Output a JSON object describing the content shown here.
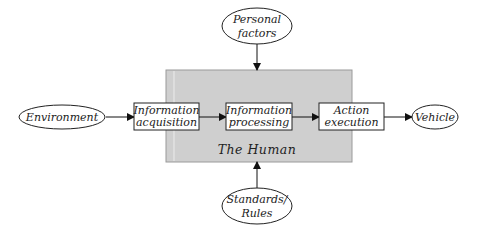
{
  "diagram": {
    "container": {
      "label": "The Human",
      "fill": "#cfcfcf",
      "stroke": "#9a9a9a"
    },
    "inputs": {
      "top": {
        "lines": [
          "Personal",
          "factors"
        ]
      },
      "bottom": {
        "lines": [
          "Standards/",
          "Rules"
        ]
      },
      "left": {
        "label": "Environment"
      }
    },
    "output": {
      "label": "Vehicle"
    },
    "stages": [
      {
        "lines": [
          "Information",
          "acquisition"
        ]
      },
      {
        "lines": [
          "Information",
          "processing"
        ]
      },
      {
        "lines": [
          "Action",
          "execution"
        ]
      }
    ],
    "edges": [
      {
        "from": "Environment",
        "to": "Information acquisition"
      },
      {
        "from": "Information acquisition",
        "to": "Information processing"
      },
      {
        "from": "Information processing",
        "to": "Action execution"
      },
      {
        "from": "Action execution",
        "to": "Vehicle"
      },
      {
        "from": "Personal factors",
        "to": "The Human"
      },
      {
        "from": "Standards/Rules",
        "to": "The Human"
      }
    ]
  }
}
